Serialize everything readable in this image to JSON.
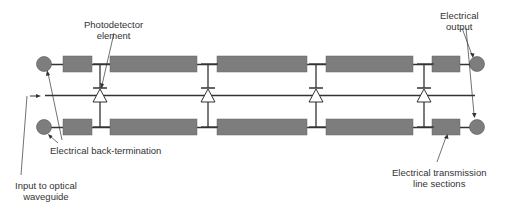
{
  "diagram": {
    "labels": {
      "photodetector": [
        "Photodetector",
        "element"
      ],
      "electrical_output": [
        "Electrical",
        "output"
      ],
      "back_termination": [
        "Electrical back-termination"
      ],
      "input_waveguide": [
        "Input to optical",
        "waveguide"
      ],
      "transmission_sections": [
        "Electrical transmission",
        "line sections"
      ]
    },
    "components": {
      "photodetector_count": 4,
      "transmission_line_sections_per_rail": 5,
      "rails": [
        "top",
        "bottom"
      ]
    },
    "colors": {
      "block_fill": "#7d7d7d",
      "line": "#333333",
      "text": "#333333"
    }
  }
}
